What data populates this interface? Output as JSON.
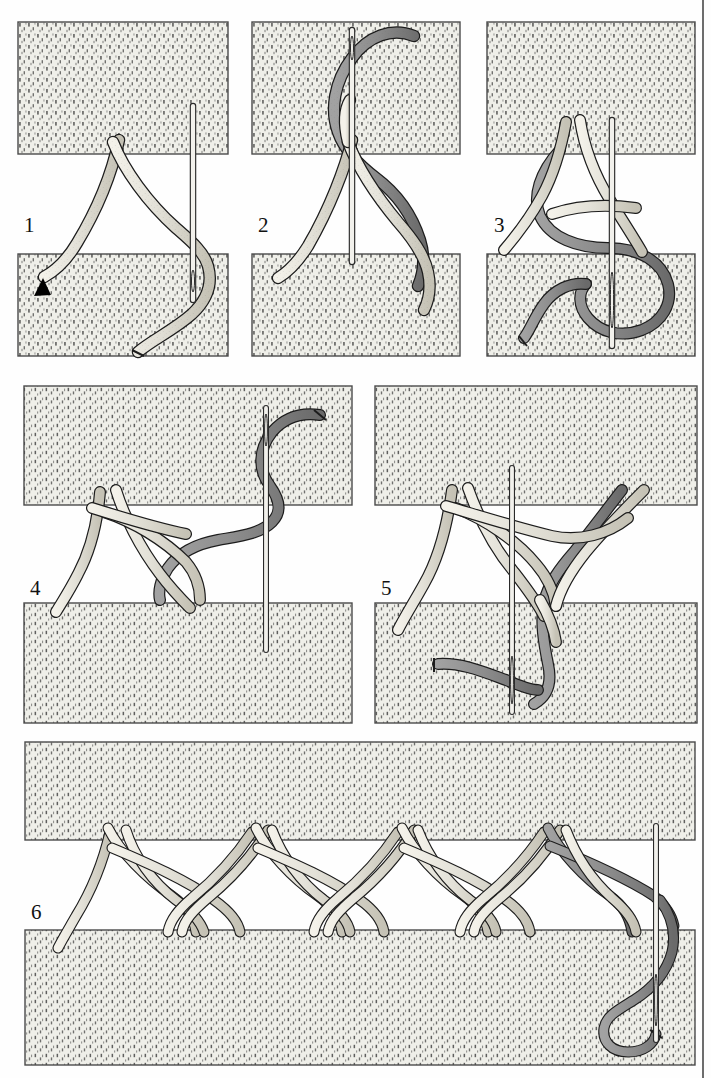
{
  "page": {
    "background_color": "#fefefe",
    "width": 711,
    "height": 1078,
    "right_rule_color": "#6d6d6d",
    "bottom_rule_color": "#6d6d6d"
  },
  "palette": {
    "fabric_fill": "#efefe9",
    "fabric_stipple": "#3a3a3a",
    "fabric_edge": "#4a4a4a",
    "thread_light_fill": "#e2e0d8",
    "thread_light_shade": "#c9c6ba",
    "thread_dark_fill": "#8c8c8c",
    "thread_dark_shade": "#6e6e6e",
    "outline": "#1c1c1c",
    "needle_fill": "#f2f1ec",
    "needle_outline": "#2a2a2a",
    "arrow_fill": "#000000"
  },
  "steps": [
    {
      "id": "step-1",
      "label": "1",
      "label_x": 24,
      "label_y": 215,
      "threads_visible": [
        "light"
      ],
      "needle": true,
      "arrow_marker": true,
      "fabric_top": {
        "x": 18,
        "y": 22,
        "w": 210,
        "h": 132
      },
      "fabric_bottom": {
        "x": 18,
        "y": 254,
        "w": 210,
        "h": 102
      }
    },
    {
      "id": "step-2",
      "label": "2",
      "label_x": 258,
      "label_y": 215,
      "threads_visible": [
        "light",
        "dark"
      ],
      "needle": true,
      "arrow_marker": false,
      "fabric_top": {
        "x": 252,
        "y": 22,
        "w": 208,
        "h": 132
      },
      "fabric_bottom": {
        "x": 252,
        "y": 254,
        "w": 208,
        "h": 102
      }
    },
    {
      "id": "step-3",
      "label": "3",
      "label_x": 494,
      "label_y": 215,
      "threads_visible": [
        "light",
        "dark"
      ],
      "needle": true,
      "arrow_marker": false,
      "fabric_top": {
        "x": 487,
        "y": 22,
        "w": 208,
        "h": 132
      },
      "fabric_bottom": {
        "x": 487,
        "y": 254,
        "w": 208,
        "h": 102
      }
    },
    {
      "id": "step-4",
      "label": "4",
      "label_x": 30,
      "label_y": 578,
      "threads_visible": [
        "light",
        "dark"
      ],
      "needle": true,
      "arrow_marker": false,
      "fabric_top": {
        "x": 24,
        "y": 386,
        "w": 328,
        "h": 119
      },
      "fabric_bottom": {
        "x": 24,
        "y": 603,
        "w": 328,
        "h": 120
      }
    },
    {
      "id": "step-5",
      "label": "5",
      "label_x": 381,
      "label_y": 578,
      "threads_visible": [
        "light",
        "dark"
      ],
      "needle": true,
      "arrow_marker": false,
      "fabric_top": {
        "x": 375,
        "y": 386,
        "w": 322,
        "h": 119
      },
      "fabric_bottom": {
        "x": 375,
        "y": 603,
        "w": 322,
        "h": 120
      }
    },
    {
      "id": "step-6",
      "label": "6",
      "label_x": 31,
      "label_y": 902,
      "threads_visible": [
        "light",
        "dark"
      ],
      "needle": true,
      "arrow_marker": false,
      "repeat_units": 4,
      "fabric_top": {
        "x": 25,
        "y": 742,
        "w": 670,
        "h": 98
      },
      "fabric_bottom": {
        "x": 25,
        "y": 930,
        "w": 670,
        "h": 135
      }
    }
  ]
}
